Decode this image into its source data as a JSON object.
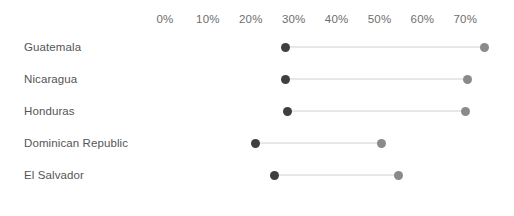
{
  "chart_data": {
    "type": "scatter",
    "subtype": "dumbbell",
    "title": "",
    "subtitle": "",
    "xlabel": "",
    "ylabel": "",
    "xlim": [
      0,
      72
    ],
    "grid": false,
    "legend": "none",
    "axis_position": "top",
    "tick_labels": [
      "0%",
      "10%",
      "20%",
      "30%",
      "40%",
      "50%",
      "60%",
      "70%"
    ],
    "tick_values": [
      0,
      10,
      20,
      30,
      40,
      50,
      60,
      70
    ],
    "categories": [
      "Guatemala",
      "Nicaragua",
      "Honduras",
      "Dominican Republic",
      "El Salvador"
    ],
    "series": [
      {
        "name": "start",
        "color": "#3f3f3f",
        "values": [
          28,
          28,
          28.5,
          21,
          25.5
        ]
      },
      {
        "name": "end",
        "color": "#8a8a8a",
        "values": [
          74.5,
          70.5,
          70,
          50.5,
          54.5
        ]
      }
    ],
    "points": [
      {
        "category": "Guatemala",
        "start": 28,
        "end": 74.5
      },
      {
        "category": "Nicaragua",
        "start": 28,
        "end": 70.5
      },
      {
        "category": "Honduras",
        "start": 28.5,
        "end": 70
      },
      {
        "category": "Dominican Republic",
        "start": 21,
        "end": 50.5
      },
      {
        "category": "El Salvador",
        "start": 25.5,
        "end": 54.5
      }
    ],
    "colors": {
      "start_dot": "#3f3f3f",
      "end_dot": "#8a8a8a",
      "connector": "#cfcfcf",
      "tick_text": "#6e6e6e",
      "label_text": "#555555",
      "background": "#ffffff"
    },
    "geometry": {
      "x_origin_px": 165,
      "px_per_percent": 4.29,
      "first_row_center_y_px": 47,
      "row_spacing_px": 32
    }
  }
}
